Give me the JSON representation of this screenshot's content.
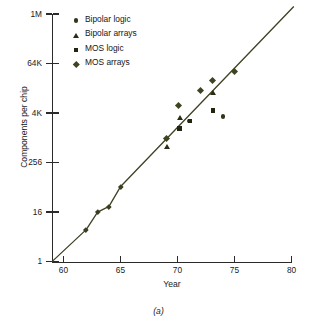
{
  "figure": {
    "caption": "(a)"
  },
  "chart_data": {
    "type": "scatter",
    "title": "",
    "xlabel": "Year",
    "ylabel": "Components per chip",
    "xlim": [
      59,
      80
    ],
    "ylim": [
      1,
      1048576
    ],
    "yscale": "log",
    "xscale": "linear",
    "grid": false,
    "legend_position": "top-left",
    "xticks": [
      60,
      65,
      70,
      75,
      80
    ],
    "xticklabels": [
      "60",
      "65",
      "70",
      "75",
      "80"
    ],
    "yticks": [
      1,
      16,
      256,
      4096,
      65536,
      1048576
    ],
    "yticklabels": [
      "1",
      "16",
      "256",
      "4K",
      "64K",
      "1M"
    ],
    "marker_color": "#3a3d1e",
    "line_color": "#3f4023",
    "axis_color": "#2b2b2b",
    "series": [
      {
        "name": "Bipolar logic",
        "marker": "circle",
        "points": [
          {
            "x": 71.0,
            "y": 2600
          },
          {
            "x": 74.0,
            "y": 3400
          }
        ]
      },
      {
        "name": "Bipolar arrays",
        "marker": "triangle",
        "points": [
          {
            "x": 69.1,
            "y": 620
          },
          {
            "x": 70.2,
            "y": 3100
          },
          {
            "x": 73.1,
            "y": 13000
          }
        ]
      },
      {
        "name": "MOS logic",
        "marker": "square",
        "points": [
          {
            "x": 70.2,
            "y": 1700
          },
          {
            "x": 71.1,
            "y": 2600
          },
          {
            "x": 73.1,
            "y": 4800
          }
        ]
      },
      {
        "name": "MOS arrays",
        "marker": "diamond",
        "points": [
          {
            "x": 62.0,
            "y": 6
          },
          {
            "x": 63.0,
            "y": 16
          },
          {
            "x": 64.0,
            "y": 22
          },
          {
            "x": 65.0,
            "y": 66
          },
          {
            "x": 69.0,
            "y": 1000
          },
          {
            "x": 70.1,
            "y": 6200
          },
          {
            "x": 72.0,
            "y": 14500
          },
          {
            "x": 73.1,
            "y": 25000
          },
          {
            "x": 75.0,
            "y": 42000
          }
        ]
      }
    ],
    "trend_line": {
      "name": "trend",
      "from": {
        "x": 59,
        "y": 1
      },
      "to": {
        "x": 80.2,
        "y": 1600000
      }
    },
    "legend_entries": [
      {
        "label": "Bipolar logic",
        "marker": "circle"
      },
      {
        "label": "Bipolar arrays",
        "marker": "triangle"
      },
      {
        "label": "MOS logic",
        "marker": "square"
      },
      {
        "label": "MOS arrays",
        "marker": "diamond"
      }
    ]
  }
}
